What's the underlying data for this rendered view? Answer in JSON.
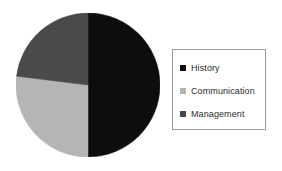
{
  "figure": {
    "background_color": "#ffffff"
  },
  "legend": {
    "position": "right",
    "border_color": "#9a9a9a",
    "background_color": "#ffffff",
    "entries": [
      {
        "label": "History",
        "color": "#0d0d0d",
        "swatch": "square-swatch"
      },
      {
        "label": "Communication",
        "color": "#b5b5b5",
        "swatch": "square-swatch"
      },
      {
        "label": "Management",
        "color": "#4a4a4a",
        "swatch": "square-swatch"
      }
    ]
  },
  "chart_data": {
    "type": "pie",
    "title": "",
    "xlabel": "",
    "ylabel": "",
    "grid": false,
    "legend_position": "right",
    "start_angle_deg": 90,
    "direction": "clockwise",
    "categories": [
      "History",
      "Communication",
      "Management"
    ],
    "values": [
      50,
      27,
      23
    ],
    "colors": [
      "#0d0d0d",
      "#b5b5b5",
      "#4a4a4a"
    ],
    "slices": [
      {
        "label": "History",
        "value": 50,
        "color": "#0d0d0d",
        "start_deg": 0,
        "end_deg": 180
      },
      {
        "label": "Communication",
        "value": 27,
        "color": "#b5b5b5",
        "start_deg": 180,
        "end_deg": 277
      },
      {
        "label": "Management",
        "value": 23,
        "color": "#4a4a4a",
        "start_deg": 277,
        "end_deg": 360
      }
    ],
    "center_x": 72,
    "center_y": 72,
    "radius": 72
  }
}
